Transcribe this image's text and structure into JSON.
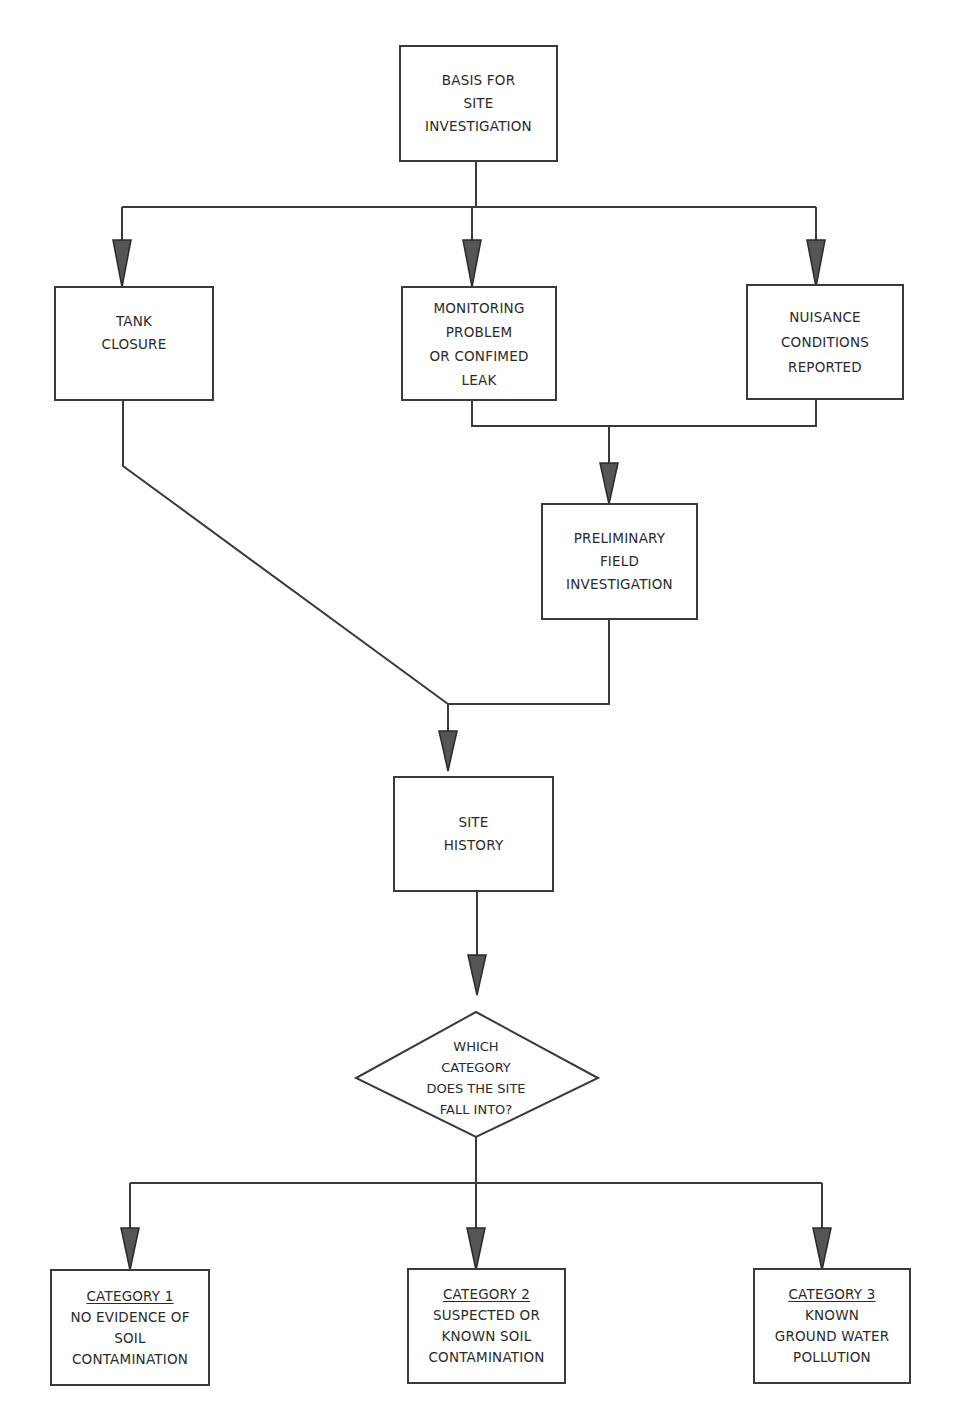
{
  "diagram": {
    "type": "flowchart",
    "nodes": {
      "basis": {
        "lines": [
          "BASIS FOR",
          "SITE",
          "INVESTIGATION"
        ]
      },
      "tank_closure": {
        "lines": [
          "TANK",
          "CLOSURE"
        ]
      },
      "monitoring": {
        "lines": [
          "MONITORING",
          "PROBLEM",
          "OR CONFIMED",
          "LEAK"
        ]
      },
      "nuisance": {
        "lines": [
          "NUISANCE",
          "CONDITIONS",
          "REPORTED"
        ]
      },
      "preliminary": {
        "lines": [
          "PRELIMINARY",
          "FIELD",
          "INVESTIGATION"
        ]
      },
      "site_history": {
        "lines": [
          "SITE",
          "HISTORY"
        ]
      },
      "decision": {
        "lines": [
          "WHICH",
          "CATEGORY",
          "DOES THE SITE",
          "FALL INTO?"
        ]
      },
      "category1": {
        "heading": "CATEGORY  1",
        "lines": [
          "NO EVIDENCE OF",
          "SOIL",
          "CONTAMINATION"
        ]
      },
      "category2": {
        "heading": "CATEGORY  2",
        "lines": [
          "SUSPECTED OR",
          "KNOWN SOIL",
          "CONTAMINATION"
        ]
      },
      "category3": {
        "heading": "CATEGORY  3",
        "lines": [
          "KNOWN",
          "GROUND WATER",
          "POLLUTION"
        ]
      }
    },
    "edges": [
      [
        "basis",
        "tank_closure"
      ],
      [
        "basis",
        "monitoring"
      ],
      [
        "basis",
        "nuisance"
      ],
      [
        "monitoring",
        "preliminary"
      ],
      [
        "nuisance",
        "preliminary"
      ],
      [
        "tank_closure",
        "site_history"
      ],
      [
        "preliminary",
        "site_history"
      ],
      [
        "site_history",
        "decision"
      ],
      [
        "decision",
        "category1"
      ],
      [
        "decision",
        "category2"
      ],
      [
        "decision",
        "category3"
      ]
    ],
    "colors": {
      "line": "#3a3a3a",
      "arrow_fill": "#555555",
      "background": "#ffffff"
    }
  }
}
